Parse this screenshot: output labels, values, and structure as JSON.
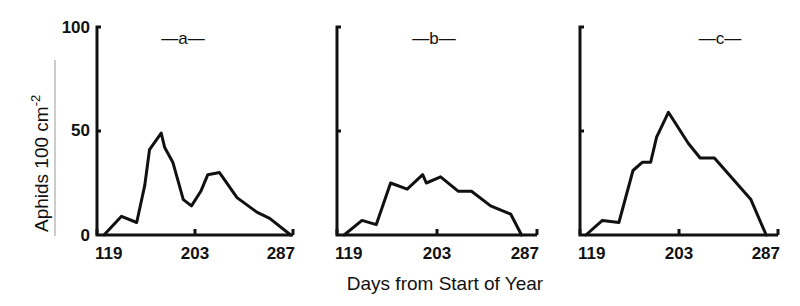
{
  "chart_data": [
    {
      "type": "line",
      "panel": "a",
      "title": "—a—",
      "xlabel": "Days from Start of Year",
      "ylabel": "Aphids 100 cm-2",
      "xlim": [
        119,
        287
      ],
      "ylim": [
        0,
        100
      ],
      "xticks": [
        119,
        203,
        287
      ],
      "yticks": [
        0,
        50,
        100
      ],
      "grid": false,
      "series": [
        {
          "name": "a",
          "x": [
            125,
            140,
            153,
            160,
            164,
            174,
            177,
            184,
            193,
            200,
            208,
            214,
            224,
            239,
            256,
            267,
            285
          ],
          "y": [
            0,
            9,
            6,
            24,
            41,
            49,
            42,
            35,
            17,
            14,
            21,
            29,
            30,
            18,
            11,
            8,
            0
          ]
        }
      ]
    },
    {
      "type": "line",
      "panel": "b",
      "title": "—b—",
      "xlabel": "Days from Start of Year",
      "ylabel": "Aphids 100 cm-2",
      "xlim": [
        119,
        287
      ],
      "ylim": [
        0,
        100
      ],
      "xticks": [
        119,
        203,
        287
      ],
      "yticks": [
        0,
        50,
        100
      ],
      "grid": false,
      "series": [
        {
          "name": "b",
          "x": [
            125,
            140,
            152,
            164,
            178,
            191,
            194,
            206,
            221,
            232,
            248,
            265,
            274
          ],
          "y": [
            0,
            7,
            5,
            25,
            22,
            29,
            25,
            28,
            21,
            21,
            14,
            10,
            0
          ]
        }
      ]
    },
    {
      "type": "line",
      "panel": "c",
      "title": "—c—",
      "xlabel": "Days from Start of Year",
      "ylabel": "Aphids 100 cm-2",
      "xlim": [
        119,
        287
      ],
      "ylim": [
        0,
        100
      ],
      "xticks": [
        119,
        203,
        287
      ],
      "yticks": [
        0,
        50,
        100
      ],
      "grid": false,
      "series": [
        {
          "name": "c",
          "x": [
            124,
            138,
            152,
            164,
            172,
            179,
            184,
            194,
            211,
            221,
            233,
            264,
            277
          ],
          "y": [
            0,
            7,
            6,
            31,
            35,
            35,
            47,
            59,
            44,
            37,
            37,
            17,
            0
          ]
        }
      ]
    }
  ],
  "labels": {
    "y_axis_title": "Aphids 100 cm",
    "y_axis_superscript": "-2",
    "x_axis_title": "Days from Start of Year",
    "y_tick_labels": [
      "100",
      "50",
      "0"
    ],
    "x_tick_labels": [
      "119",
      "203",
      "287"
    ],
    "panel_titles": [
      "—a—",
      "—b—",
      "—c—"
    ]
  }
}
